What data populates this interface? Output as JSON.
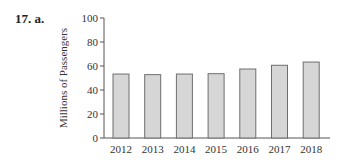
{
  "problem": {
    "label": "17. a."
  },
  "chart_data": {
    "type": "bar",
    "title": "",
    "xlabel": "",
    "ylabel": "Millions of Passengers",
    "ylim": [
      0,
      100
    ],
    "yticks": [
      0,
      20,
      40,
      60,
      80,
      100
    ],
    "categories": [
      "2012",
      "2013",
      "2014",
      "2015",
      "2016",
      "2017",
      "2018"
    ],
    "values": [
      53.3,
      52.8,
      53.3,
      53.6,
      57.5,
      60.6,
      63.3
    ],
    "grid": false,
    "legend": null,
    "colors": {
      "bar_fill": "#d6d6d6",
      "bar_stroke": "#6e6e6e",
      "axis": "#555555"
    }
  }
}
